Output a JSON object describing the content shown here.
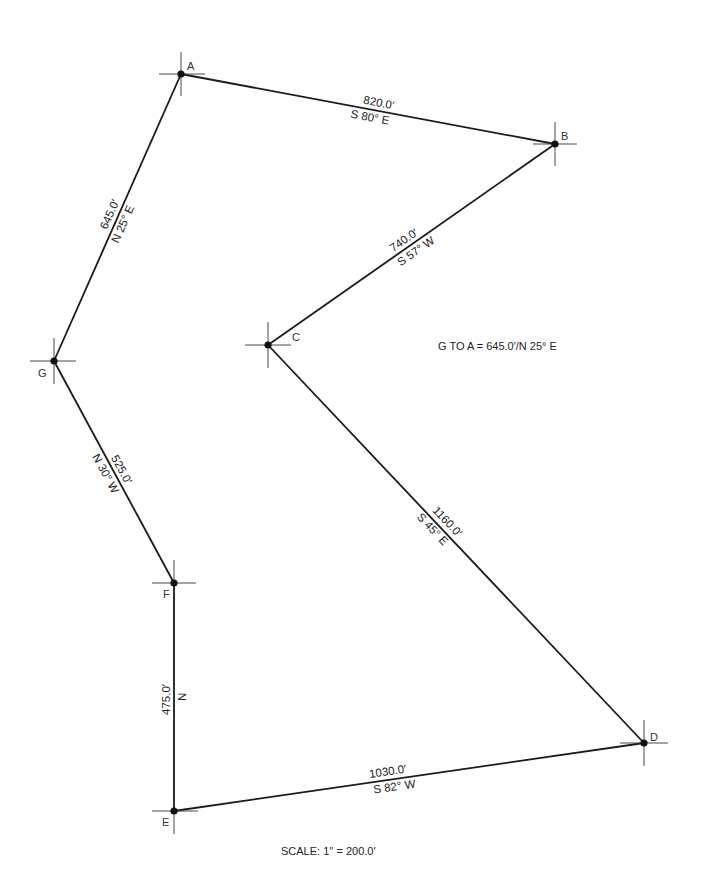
{
  "diagram": {
    "type": "traverse-survey-plot",
    "points": [
      {
        "id": "A",
        "x": 181,
        "y": 74
      },
      {
        "id": "B",
        "x": 555,
        "y": 144
      },
      {
        "id": "C",
        "x": 268,
        "y": 345
      },
      {
        "id": "D",
        "x": 644,
        "y": 743
      },
      {
        "id": "E",
        "x": 174,
        "y": 811
      },
      {
        "id": "F",
        "x": 174,
        "y": 583
      },
      {
        "id": "G",
        "x": 54,
        "y": 361
      }
    ],
    "courses": [
      {
        "from": "A",
        "to": "B",
        "distance": "820.0′",
        "bearing": "S 80° E"
      },
      {
        "from": "B",
        "to": "C",
        "distance": "740.0′",
        "bearing": "S 57° W"
      },
      {
        "from": "C",
        "to": "D",
        "distance": "1160.0′",
        "bearing": "S 45° E"
      },
      {
        "from": "D",
        "to": "E",
        "distance": "1030.0′",
        "bearing": "S 82° W"
      },
      {
        "from": "E",
        "to": "F",
        "distance": "475.0′",
        "bearing": "N"
      },
      {
        "from": "F",
        "to": "G",
        "distance": "525.0′",
        "bearing": "N 30° W"
      },
      {
        "from": "G",
        "to": "A",
        "distance": "645.0′",
        "bearing": "N 25° E"
      }
    ],
    "labels": {
      "A": "A",
      "B": "B",
      "C": "C",
      "D": "D",
      "E": "E",
      "F": "F",
      "G": "G"
    },
    "annotation": "G TO A = 645.0′/N 25° E",
    "scale": "SCALE: 1′′ = 200.0′",
    "line_color": "#1a1a1a"
  }
}
